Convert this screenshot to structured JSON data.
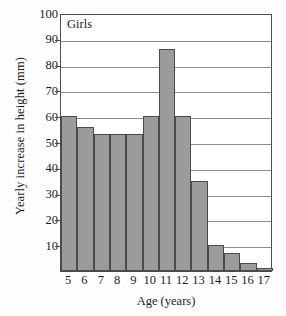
{
  "chart_data": {
    "type": "bar",
    "title": "",
    "plot_label": "Girls",
    "xlabel": "Age (years)",
    "ylabel": "Yearly increase in height (mm)",
    "categories": [
      "5",
      "6",
      "7",
      "8",
      "9",
      "10",
      "11",
      "12",
      "13",
      "14",
      "15",
      "16",
      "17"
    ],
    "values": [
      60,
      56,
      53,
      53,
      53,
      60,
      86,
      60,
      35,
      10,
      7,
      3,
      1
    ],
    "ylim": [
      0,
      100
    ],
    "xlim": [
      4.5,
      17.5
    ],
    "ytick_labels": [
      "100",
      "90",
      "80",
      "70",
      "60",
      "50",
      "40",
      "30",
      "20",
      "10"
    ],
    "ytick_values": [
      100,
      90,
      80,
      70,
      60,
      50,
      40,
      30,
      20,
      10
    ],
    "grid": true,
    "legend": "none",
    "bar_fill_color": "#9b9b9b",
    "bar_edge_color": "#4a4a4a",
    "gridline_color": "#8d8d8d",
    "axis_color": "#4d4d4d"
  }
}
